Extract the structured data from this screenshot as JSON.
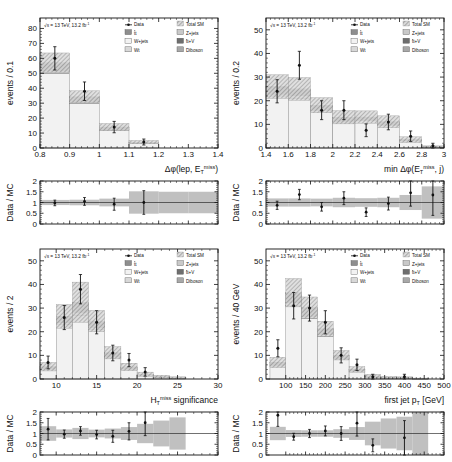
{
  "figure": {
    "name": "four-panel-stacked-histogram-with-ratio",
    "lumi_text": "= 13 TeV, 13.2 fb",
    "lumi_prefix": "s",
    "lumi_exp": "-1",
    "ratio_ylabel": "Data / MC",
    "ratio_ticks": [
      "0",
      "0.5",
      "1",
      "1.5",
      "2"
    ],
    "ratio_ylim": [
      0,
      2
    ]
  },
  "legend": {
    "entries": [
      {
        "label": "Data",
        "marker": "point",
        "color": "#111111"
      },
      {
        "label": "Total SM",
        "marker": "hatch",
        "color": "#9a9a9a"
      },
      {
        "label": "tt",
        "marker": "box",
        "color": "#8e8e8e"
      },
      {
        "label": "Z+jets",
        "marker": "box",
        "color": "#c9c9c9"
      },
      {
        "label": "W+jets",
        "marker": "box",
        "color": "#f2f2f2"
      },
      {
        "label": "tt+V",
        "marker": "box",
        "color": "#6e6e6e"
      },
      {
        "label": "Wt",
        "marker": "box",
        "color": "#d8d8d8"
      },
      {
        "label": "Diboson",
        "marker": "box",
        "color": "#a8a8a8"
      }
    ]
  },
  "chart_data": [
    {
      "id": "dphi-lep-met",
      "type": "bar",
      "title": "",
      "xlabel": "Δφ(lep, E",
      "xlabel_sub": "T",
      "xlabel_sup": "miss",
      "xlabel_tail": ")",
      "ylabel": "events / 0.1",
      "xlim": [
        0.8,
        1.4
      ],
      "ylim": [
        0,
        87
      ],
      "xticks": [
        0.8,
        0.9,
        1.0,
        1.1,
        1.2,
        1.3,
        1.4
      ],
      "xticklabels": [
        "0.8",
        "0.9",
        "1",
        "1.1",
        "1.2",
        "1.3",
        "1.4"
      ],
      "yticks": [
        0,
        10,
        20,
        30,
        40,
        50,
        60,
        70,
        80
      ],
      "yticklabels": [
        "0",
        "10",
        "20",
        "30",
        "40",
        "50",
        "60",
        "70",
        "80"
      ],
      "bin_edges": [
        0.8,
        0.9,
        1.0,
        1.1,
        1.2,
        1.3,
        1.4
      ],
      "series": [
        {
          "name": "W+jets",
          "values": [
            50.0,
            30.0,
            12.0,
            3.4,
            0,
            0
          ]
        },
        {
          "name": "tt",
          "values": [
            5.0,
            3.0,
            1.5,
            0.4,
            0,
            0
          ]
        },
        {
          "name": "Wt",
          "values": [
            1.5,
            1.0,
            0.4,
            0.1,
            0,
            0
          ]
        },
        {
          "name": "Z+jets",
          "values": [
            0.6,
            0.3,
            0.1,
            0.05,
            0,
            0
          ]
        }
      ],
      "total_sm": [
        57.1,
        34.3,
        14.0,
        3.95,
        0,
        0
      ],
      "total_sm_err": [
        6.5,
        4.0,
        2.4,
        1.1,
        0,
        0
      ],
      "data_x": [
        0.85,
        0.95,
        1.05,
        1.15
      ],
      "data_y": [
        60,
        38,
        14,
        4
      ],
      "data_err": [
        7.8,
        6.2,
        3.8,
        2.0
      ],
      "ratio_x": [
        0.85,
        0.95,
        1.05,
        1.15
      ],
      "ratio_y": [
        0.98,
        1.05,
        0.92,
        1.0
      ],
      "ratio_err": [
        0.13,
        0.18,
        0.28,
        0.55
      ],
      "ratio_band": [
        0.12,
        0.13,
        0.18,
        0.52,
        0.5,
        0.5
      ]
    },
    {
      "id": "min-dphi-met-jet",
      "type": "bar",
      "title": "",
      "xlabel": "min Δφ(E",
      "xlabel_sub": "T",
      "xlabel_sup": "miss",
      "xlabel_tail": ", j)",
      "ylabel": "events / 0.2",
      "xlim": [
        1.4,
        3.0
      ],
      "ylim": [
        0,
        55
      ],
      "xticks": [
        1.4,
        1.6,
        1.8,
        2.0,
        2.2,
        2.4,
        2.6,
        2.8,
        3.0
      ],
      "xticklabels": [
        "1.4",
        "1.6",
        "1.8",
        "2",
        "2.2",
        "2.4",
        "2.6",
        "2.8",
        "3"
      ],
      "yticks": [
        0,
        10,
        20,
        30,
        40,
        50
      ],
      "yticklabels": [
        "0",
        "10",
        "20",
        "30",
        "40",
        "50"
      ],
      "bin_edges": [
        1.4,
        1.6,
        1.8,
        2.0,
        2.2,
        2.4,
        2.6,
        2.8,
        3.0
      ],
      "series": [
        {
          "name": "W+jets",
          "values": [
            22.0,
            21.0,
            16.0,
            11.0,
            11.5,
            9.5,
            3.0,
            0.4
          ]
        },
        {
          "name": "tt",
          "values": [
            3.0,
            2.5,
            1.6,
            1.5,
            1.2,
            1.2,
            0.4,
            0.05
          ]
        },
        {
          "name": "Wt",
          "values": [
            0.8,
            1.2,
            0.4,
            0.4,
            0.3,
            0.3,
            0.1,
            0.03
          ]
        },
        {
          "name": "Z+jets",
          "values": [
            0.2,
            0.3,
            0.1,
            0.1,
            0.1,
            0.1,
            0.02,
            0.02
          ]
        }
      ],
      "total_sm": [
        26.0,
        25.0,
        18.1,
        13.0,
        13.1,
        11.1,
        3.52,
        0.5
      ],
      "total_sm_err": [
        5.0,
        4.8,
        3.2,
        2.8,
        2.6,
        2.5,
        1.2,
        0.4
      ],
      "data_x": [
        1.5,
        1.7,
        1.9,
        2.1,
        2.3,
        2.5,
        2.7,
        2.9
      ],
      "data_y": [
        24,
        35,
        16,
        16,
        7.5,
        11,
        5,
        1
      ],
      "data_err": [
        4.9,
        5.9,
        4.0,
        4.0,
        2.7,
        3.3,
        2.2,
        1.0
      ],
      "ratio_x": [
        1.5,
        1.7,
        1.9,
        2.1,
        2.3,
        2.5,
        2.7,
        2.9
      ],
      "ratio_y": [
        0.87,
        1.37,
        0.8,
        1.2,
        0.55,
        0.95,
        1.45,
        1.35
      ],
      "ratio_err": [
        0.19,
        0.24,
        0.2,
        0.3,
        0.2,
        0.3,
        0.62,
        0.95
      ],
      "ratio_band": [
        0.19,
        0.19,
        0.18,
        0.22,
        0.2,
        0.22,
        0.35,
        0.75
      ]
    },
    {
      "id": "htmiss-significance",
      "type": "bar",
      "title": "",
      "xlabel": "H",
      "xlabel_sub": "T",
      "xlabel_sup": "miss",
      "xlabel_tail": " significance",
      "ylabel": "events / 2",
      "xlim": [
        8,
        30
      ],
      "ylim": [
        0,
        55
      ],
      "xticks": [
        10,
        15,
        20,
        25,
        30
      ],
      "xticklabels": [
        "10",
        "15",
        "20",
        "25",
        "30"
      ],
      "yticks": [
        0,
        10,
        20,
        30,
        40,
        50
      ],
      "yticklabels": [
        "0",
        "10",
        "20",
        "30",
        "40",
        "50"
      ],
      "bin_edges": [
        8,
        10,
        12,
        14,
        16,
        18,
        20,
        22,
        24,
        26
      ],
      "series": [
        {
          "name": "W+jets",
          "values": [
            4.0,
            23.0,
            27.0,
            21.0,
            9.0,
            4.0,
            1.6,
            0.8,
            0.4
          ]
        },
        {
          "name": "tt",
          "values": [
            0.8,
            2.5,
            4.0,
            2.5,
            1.6,
            0.8,
            0.3,
            0.15,
            0.08
          ]
        },
        {
          "name": "Wt",
          "values": [
            0.3,
            0.8,
            1.2,
            0.8,
            0.4,
            0.25,
            0.1,
            0.05,
            0.02
          ]
        },
        {
          "name": "Z+jets",
          "values": [
            0.1,
            0.2,
            0.3,
            0.2,
            0.1,
            0.05,
            0.02,
            0.02,
            0.01
          ]
        }
      ],
      "total_sm": [
        5.2,
        26.5,
        32.5,
        24.5,
        11.1,
        5.1,
        2.02,
        1.02,
        0.51
      ],
      "total_sm_err": [
        1.8,
        5.0,
        8.5,
        4.5,
        2.6,
        1.6,
        0.9,
        0.6,
        0.4
      ],
      "data_x": [
        9,
        11,
        13,
        15,
        17,
        19,
        21
      ],
      "data_y": [
        7,
        26,
        38,
        24,
        11,
        8,
        3
      ],
      "data_err": [
        2.7,
        5.1,
        6.2,
        4.9,
        3.3,
        2.8,
        1.8
      ],
      "ratio_x": [
        9,
        11,
        13,
        15,
        17,
        19,
        21
      ],
      "ratio_y": [
        1.2,
        0.97,
        1.12,
        0.95,
        0.87,
        1.1,
        1.5
      ],
      "ratio_err": [
        0.5,
        0.19,
        0.2,
        0.2,
        0.28,
        0.4,
        0.6
      ],
      "ratio_band": [
        0.34,
        0.19,
        0.26,
        0.18,
        0.23,
        0.3,
        0.45,
        0.6,
        0.75
      ]
    },
    {
      "id": "first-jet-pt",
      "type": "bar",
      "title": "",
      "xlabel": "first jet p",
      "xlabel_sub": "T",
      "xlabel_sup": "",
      "xlabel_tail": "  [GeV]",
      "ylabel": "events / 40 GeV",
      "xlim": [
        50,
        500
      ],
      "ylim": [
        0,
        55
      ],
      "xticks": [
        100,
        150,
        200,
        250,
        300,
        350,
        400,
        450,
        500
      ],
      "xticklabels": [
        "100",
        "150",
        "200",
        "250",
        "300",
        "350",
        "400",
        "450",
        "500"
      ],
      "yticks": [
        0,
        10,
        20,
        30,
        40,
        50
      ],
      "yticklabels": [
        "0",
        "10",
        "20",
        "30",
        "40",
        "50"
      ],
      "bin_edges": [
        60,
        100,
        140,
        180,
        220,
        260,
        300,
        340,
        380,
        420,
        460
      ],
      "series": [
        {
          "name": "W+jets",
          "values": [
            5.5,
            31.0,
            25.5,
            18.0,
            8.5,
            3.2,
            1.0,
            0.5,
            0.4,
            0.15
          ]
        },
        {
          "name": "tt",
          "values": [
            1.0,
            4.0,
            3.5,
            2.4,
            1.2,
            0.6,
            0.2,
            0.1,
            0.08,
            0.03
          ]
        },
        {
          "name": "Wt",
          "values": [
            0.4,
            1.2,
            1.0,
            0.7,
            0.3,
            0.2,
            0.05,
            0.03,
            0.02,
            0.01
          ]
        },
        {
          "name": "Z+jets",
          "values": [
            0.1,
            0.3,
            0.2,
            0.15,
            0.05,
            0.03,
            0.01,
            0.01,
            0.01,
            0.0
          ]
        }
      ],
      "total_sm": [
        7.0,
        36.5,
        30.2,
        21.25,
        10.05,
        4.03,
        1.26,
        0.64,
        0.51,
        0.19
      ],
      "total_sm_err": [
        2.2,
        6.0,
        4.5,
        3.2,
        2.0,
        1.2,
        0.7,
        0.45,
        0.4,
        0.2
      ],
      "data_x": [
        80,
        120,
        160,
        200,
        240,
        280,
        320,
        400
      ],
      "data_y": [
        13,
        31,
        30,
        24,
        10,
        6,
        1,
        1
      ],
      "data_err": [
        3.6,
        5.6,
        5.5,
        4.9,
        3.2,
        2.4,
        1.0,
        1.0
      ],
      "ratio_x": [
        80,
        120,
        160,
        200,
        240,
        280,
        320,
        400
      ],
      "ratio_y": [
        1.85,
        0.85,
        1.0,
        1.12,
        1.0,
        1.48,
        0.45,
        0.8
      ],
      "ratio_err": [
        0.52,
        0.16,
        0.19,
        0.23,
        0.32,
        0.6,
        0.3,
        0.8
      ],
      "ratio_band": [
        0.31,
        0.16,
        0.15,
        0.15,
        0.2,
        0.3,
        0.55,
        0.7,
        0.78,
        1.0
      ]
    }
  ]
}
